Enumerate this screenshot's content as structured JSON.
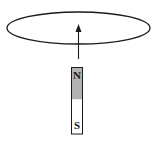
{
  "diagram": {
    "type": "physics-electromagnetic-induction",
    "elements": {
      "loop": {
        "shape": "ellipse",
        "stroke": "#1a1a1a"
      },
      "arrow": {
        "direction": "up",
        "stroke": "#1a1a1a"
      },
      "magnet": {
        "north_label": "N",
        "south_label": "S",
        "north_color": "#b3b3b3",
        "south_color": "#ffffff",
        "border": "#1a1a1a"
      }
    }
  }
}
